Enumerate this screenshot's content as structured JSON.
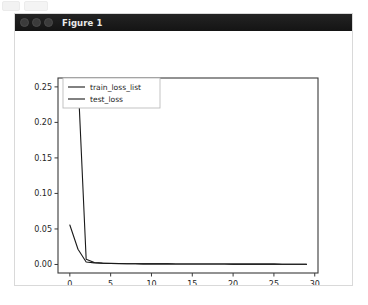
{
  "window": {
    "title": "Figure 1",
    "traffic_lights": [
      "close",
      "minimize",
      "zoom"
    ]
  },
  "chart_data": {
    "type": "line",
    "title": "",
    "xlabel": "n iteration",
    "ylabel": "",
    "xlim": [
      -1.45,
      30.4
    ],
    "ylim": [
      -0.012,
      0.2625
    ],
    "xticks": [
      0,
      5,
      10,
      15,
      20,
      25,
      30
    ],
    "xtick_labels": [
      "0",
      "5",
      "10",
      "15",
      "20",
      "25",
      "30"
    ],
    "yticks": [
      0.0,
      0.05,
      0.1,
      0.15,
      0.2,
      0.25
    ],
    "ytick_labels": [
      "0.00",
      "0.05",
      "0.10",
      "0.15",
      "0.20",
      "0.25"
    ],
    "grid": false,
    "legend_position": "upper left",
    "series": [
      {
        "name": "train_loss_list",
        "color": "#1a1a1a",
        "x": [
          0,
          1,
          2,
          3,
          4,
          5,
          6,
          7,
          8,
          9,
          10,
          11,
          12,
          13,
          14,
          15,
          16,
          17,
          18,
          19,
          20,
          21,
          22,
          23,
          24,
          25,
          26,
          27,
          28,
          29
        ],
        "y": [
          0.285,
          0.262,
          0.0075,
          0.0028,
          0.0019,
          0.0015,
          0.0013,
          0.0011,
          0.001,
          0.0009,
          0.0009,
          0.0008,
          0.0008,
          0.0007,
          0.0007,
          0.0007,
          0.0006,
          0.0006,
          0.0006,
          0.0006,
          0.0005,
          0.0005,
          0.0005,
          0.0005,
          0.0005,
          0.0005,
          0.0004,
          0.0004,
          0.0004,
          0.0004
        ]
      },
      {
        "name": "test_loss",
        "color": "#1a1a1a",
        "x": [
          0,
          1,
          2,
          3,
          4,
          5,
          6,
          7,
          8,
          9,
          10,
          11,
          12,
          13,
          14,
          15,
          16,
          17,
          18,
          19,
          20,
          21,
          22,
          23,
          24,
          25,
          26,
          27,
          28,
          29
        ],
        "y": [
          0.0555,
          0.0215,
          0.0035,
          0.0022,
          0.0017,
          0.0014,
          0.0012,
          0.0011,
          0.001,
          0.0009,
          0.0009,
          0.0008,
          0.0008,
          0.0007,
          0.0007,
          0.0007,
          0.0006,
          0.0006,
          0.0006,
          0.0006,
          0.0005,
          0.0005,
          0.0005,
          0.0005,
          0.0005,
          0.0005,
          0.0004,
          0.0004,
          0.0004,
          0.0004
        ]
      }
    ]
  }
}
